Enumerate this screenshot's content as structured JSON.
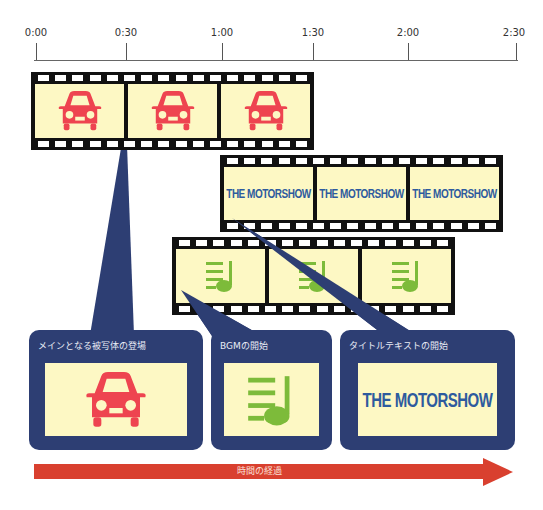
{
  "timeline": {
    "ticks": [
      {
        "label": "0:00",
        "x": 36
      },
      {
        "label": "0:30",
        "x": 126
      },
      {
        "label": "1:00",
        "x": 222
      },
      {
        "label": "1:30",
        "x": 313
      },
      {
        "label": "2:00",
        "x": 408
      },
      {
        "label": "2:30",
        "x": 516
      }
    ]
  },
  "tracks": [
    {
      "name": "main-subject",
      "icon": "car-icon",
      "frames": 3
    },
    {
      "name": "title-text",
      "frame_text": "THE MOTORSHOW",
      "frames": 3
    },
    {
      "name": "bgm",
      "icon": "music-list-icon",
      "frames": 3
    }
  ],
  "callouts": [
    {
      "label": "メインとなる被写体の登場",
      "icon": "car-icon"
    },
    {
      "label": "BGMの開始",
      "icon": "music-list-icon"
    },
    {
      "label": "タイトルテキストの開始",
      "text": "THE MOTORSHOW"
    }
  ],
  "arrow": {
    "label": "時間の経過"
  },
  "colors": {
    "callout_bg": "#2d3e73",
    "frame_bg": "#fdf8c4",
    "car": "#ee4450",
    "music": "#7dbb3a",
    "title_text": "#2e5b9e",
    "arrow": "#d9402f"
  }
}
